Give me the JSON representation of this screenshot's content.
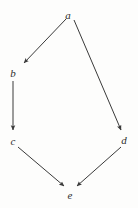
{
  "diagram": {
    "background_color": "#fdfdfc",
    "stroke_color": "#3a3a3a",
    "label_color": "#2e2e2e",
    "width": 138,
    "height": 208
  },
  "chart_data": {
    "type": "diagram",
    "subtype": "directed-graph",
    "title": "",
    "xlabel": "",
    "ylabel": "",
    "grid": false,
    "legend": null,
    "nodes": [
      {
        "id": "a",
        "label": "a",
        "x": 68,
        "y": 15
      },
      {
        "id": "b",
        "label": "b",
        "x": 13,
        "y": 73
      },
      {
        "id": "c",
        "label": "c",
        "x": 13,
        "y": 141
      },
      {
        "id": "d",
        "label": "d",
        "x": 124,
        "y": 140
      },
      {
        "id": "e",
        "label": "e",
        "x": 70,
        "y": 195
      }
    ],
    "edges": [
      {
        "id": "a-b",
        "from": "a",
        "to": "b",
        "x1": 66,
        "y1": 19,
        "x2": 24,
        "y2": 63,
        "directed": true
      },
      {
        "id": "a-d",
        "from": "a",
        "to": "d",
        "x1": 74,
        "y1": 20,
        "x2": 121,
        "y2": 130,
        "directed": true
      },
      {
        "id": "b-c",
        "from": "b",
        "to": "c",
        "x1": 13,
        "y1": 81,
        "x2": 13,
        "y2": 130,
        "directed": true
      },
      {
        "id": "c-e",
        "from": "c",
        "to": "e",
        "x1": 18,
        "y1": 147,
        "x2": 64,
        "y2": 186,
        "directed": true
      },
      {
        "id": "d-e",
        "from": "d",
        "to": "e",
        "x1": 121,
        "y1": 147,
        "x2": 77,
        "y2": 186,
        "directed": true
      }
    ]
  }
}
